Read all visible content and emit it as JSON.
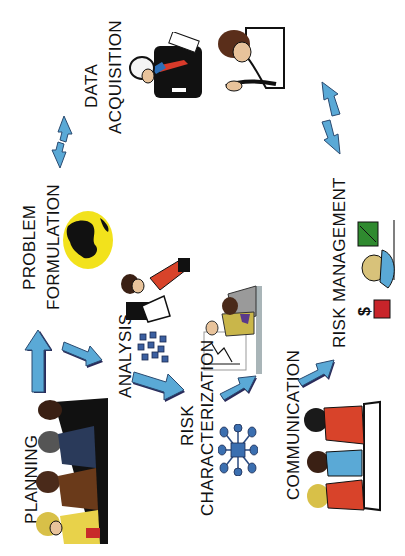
{
  "diagram": {
    "type": "risk-assessment-process",
    "orientation": "rotated-90-ccw",
    "colors": {
      "arrow": "#5AA9D6",
      "arrow_shadow": "#2A2A5A",
      "globe": "#F2E21C",
      "network": "#3B6FB0"
    },
    "stages": [
      {
        "id": "planning",
        "lines": [
          "PLANNING"
        ],
        "image": "meeting-people-icon"
      },
      {
        "id": "problem-formulation",
        "lines": [
          "PROBLEM",
          "FORMULATION"
        ],
        "image": "globe-icon"
      },
      {
        "id": "analysis",
        "lines": [
          "ANALYSIS"
        ],
        "image": "network-cubes-icon"
      },
      {
        "id": "risk-characterization",
        "lines": [
          "RISK",
          "CHARACTERIZATION"
        ],
        "image": "presentation-icon"
      },
      {
        "id": "communication",
        "lines": [
          "COMMUNICATION"
        ],
        "image": "audience-icon"
      },
      {
        "id": "risk-management",
        "lines": [
          "RISK MANAGEMENT"
        ],
        "image": "manager-icon"
      },
      {
        "id": "data-acquisition",
        "lines": [
          "DATA",
          "ACQUISITION"
        ],
        "image": "field-worker-icon"
      }
    ],
    "arrows": [
      {
        "from": "planning",
        "to": "problem-formulation",
        "style": "single"
      },
      {
        "from": "problem-formulation",
        "to": "analysis",
        "style": "single"
      },
      {
        "from": "analysis",
        "to": "risk-characterization",
        "style": "single"
      },
      {
        "from": "risk-characterization",
        "to": "communication",
        "style": "single"
      },
      {
        "from": "communication",
        "to": "risk-management",
        "style": "single"
      },
      {
        "from": "problem-formulation",
        "to": "data-acquisition",
        "style": "double"
      },
      {
        "from": "data-acquisition",
        "to": "risk-management",
        "style": "double"
      }
    ]
  }
}
